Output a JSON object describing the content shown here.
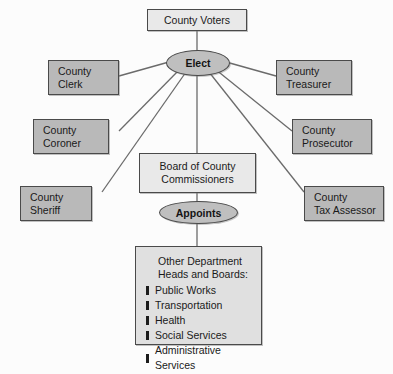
{
  "diagram": {
    "type": "org-chart",
    "colors": {
      "office_box_fill": "#b9b9b9",
      "light_box_fill": "#e9e9e9",
      "dept_box_fill": "#e0e0e0",
      "ellipse_fill": "#bfbfbf",
      "border": "#4a4a4a",
      "line": "#6b6b6b",
      "text": "#1a1a1a",
      "background": "#fcfcfc"
    }
  },
  "nodes": {
    "voters": {
      "label": "County Voters"
    },
    "elect": {
      "label": "Elect"
    },
    "appoints": {
      "label": "Appoints"
    },
    "board": {
      "label": "Board of County\nCommissioners"
    },
    "clerk": {
      "label": "County\nClerk"
    },
    "treasurer": {
      "label": "County\nTreasurer"
    },
    "coroner": {
      "label": "County\nCoroner"
    },
    "prosecutor": {
      "label": "County\nProsecutor"
    },
    "sheriff": {
      "label": "County\nSheriff"
    },
    "tax_assessor": {
      "label": "County\nTax Assessor"
    }
  },
  "departments": {
    "title": "Other Department\nHeads and Boards:",
    "items": [
      "Public Works",
      "Transportation",
      "Health",
      "Social Services",
      "Administrative Services"
    ]
  },
  "edges": [
    {
      "from": "voters",
      "to": "elect"
    },
    {
      "from": "elect",
      "to": "clerk"
    },
    {
      "from": "elect",
      "to": "treasurer"
    },
    {
      "from": "elect",
      "to": "coroner"
    },
    {
      "from": "elect",
      "to": "prosecutor"
    },
    {
      "from": "elect",
      "to": "sheriff"
    },
    {
      "from": "elect",
      "to": "tax_assessor"
    },
    {
      "from": "elect",
      "to": "board"
    },
    {
      "from": "board",
      "to": "appoints"
    },
    {
      "from": "appoints",
      "to": "departments"
    }
  ]
}
